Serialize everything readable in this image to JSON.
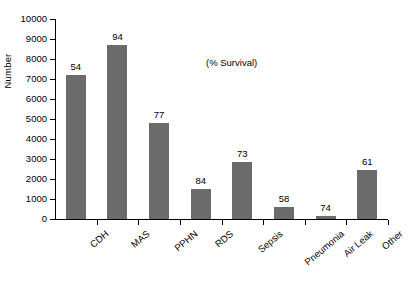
{
  "chart_data": {
    "type": "bar",
    "title": "",
    "xlabel": "",
    "ylabel": "Number",
    "ylim": [
      0,
      10000
    ],
    "ytick_step": 1000,
    "yticks": [
      "0",
      "1000",
      "2000",
      "3000",
      "4000",
      "5000",
      "6000",
      "7000",
      "8000",
      "9000",
      "10000"
    ],
    "grid": false,
    "legend": "none",
    "annotation": "(% Survival)",
    "bar_color": "#6b6b6b",
    "axis_color": "#000000",
    "categories": [
      "CDH",
      "MAS",
      "PPHN",
      "RDS",
      "Sepsis",
      "Pneumonia",
      "Air Leak",
      "Other"
    ],
    "values": [
      7200,
      8700,
      4800,
      1500,
      2850,
      620,
      150,
      2450
    ],
    "data_labels": [
      "54",
      "94",
      "77",
      "84",
      "73",
      "58",
      "74",
      "61"
    ],
    "data_label_meaning": "% Survival"
  },
  "caption": ""
}
